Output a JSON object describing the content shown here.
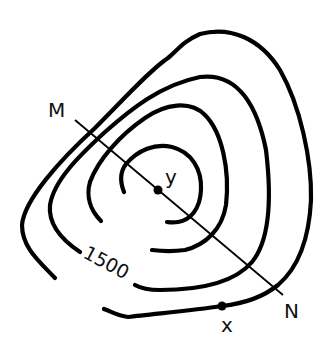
{
  "diagram": {
    "type": "topographic-contour-map",
    "contour_count": 4,
    "elevation_label": "1500",
    "transect": {
      "start_label": "M",
      "end_label": "N"
    },
    "points": [
      {
        "id": "summit",
        "label": "y"
      },
      {
        "id": "point-x",
        "label": "x"
      }
    ],
    "colors": {
      "line": "#000000",
      "background": "#ffffff"
    }
  }
}
